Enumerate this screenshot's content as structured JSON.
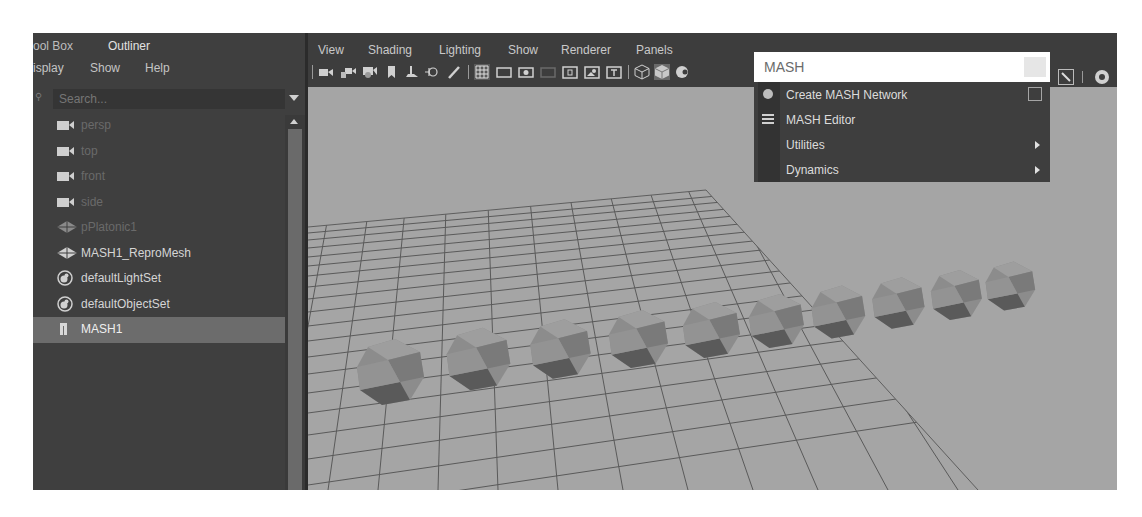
{
  "outliner": {
    "tabs": [
      {
        "label": "ool Box",
        "active": false
      },
      {
        "label": "Outliner",
        "active": true
      }
    ],
    "menu": [
      "isplay",
      "Show",
      "Help"
    ],
    "search": {
      "placeholder": "Search..."
    },
    "items": [
      {
        "label": "persp",
        "icon": "camera-icon",
        "dim": true
      },
      {
        "label": "top",
        "icon": "camera-icon",
        "dim": true
      },
      {
        "label": "front",
        "icon": "camera-icon",
        "dim": true
      },
      {
        "label": "side",
        "icon": "camera-icon",
        "dim": true
      },
      {
        "label": "pPlatonic1",
        "icon": "mesh-icon",
        "dim": true
      },
      {
        "label": "MASH1_ReproMesh",
        "icon": "mesh-icon",
        "dim": false
      },
      {
        "label": "defaultLightSet",
        "icon": "set-icon",
        "dim": false
      },
      {
        "label": "defaultObjectSet",
        "icon": "set-icon",
        "dim": false
      },
      {
        "label": "MASH1",
        "icon": "mash-icon",
        "dim": false,
        "selected": true
      }
    ]
  },
  "viewport": {
    "menu": [
      "View",
      "Shading",
      "Lighting",
      "Show",
      "Renderer",
      "Panels"
    ],
    "toolbar_icons": [
      "camera-icon",
      "camera-lock-icon",
      "camera-attr-icon",
      "bookmark-icon",
      "image-plane-icon",
      "2d-pan-icon",
      "grease-pencil-icon",
      "grid-icon",
      "film-gate-icon",
      "resolution-gate-icon",
      "gate-mask-icon",
      "field-chart-icon",
      "safe-action-icon",
      "safe-title-icon",
      "wireframe-icon",
      "smooth-shade-icon",
      "shade-options-icon"
    ],
    "objects": {
      "type": "icosahedron",
      "count": 10
    }
  },
  "popup": {
    "search_value": "MASH",
    "items": [
      {
        "label": "Create MASH Network",
        "icon": "mash-node-icon",
        "option_box": true,
        "submenu": false
      },
      {
        "label": "MASH Editor",
        "icon": "list-icon",
        "option_box": false,
        "submenu": false
      },
      {
        "label": "Utilities",
        "icon": "",
        "option_box": false,
        "submenu": true
      },
      {
        "label": "Dynamics",
        "icon": "",
        "option_box": false,
        "submenu": true
      }
    ]
  },
  "colors": {
    "panel_bg": "#3f3f3f",
    "viewport_bg": "#a5a5a5",
    "selection": "#6c6c6c",
    "grid_line": "#5a5a5a"
  }
}
